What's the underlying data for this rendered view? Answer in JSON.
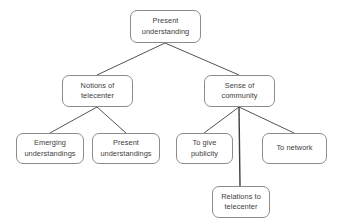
{
  "diagram": {
    "type": "tree-hierarchy",
    "orientation": "top-down",
    "style": {
      "node_border_color": "#8c8c8c",
      "node_fill_color": "#ffffff",
      "edge_color": "#3f3f3f",
      "text_color": "#3d3d3d",
      "background_color": "#ffffff"
    },
    "nodes": [
      {
        "id": "root",
        "label": "Present understanding",
        "x": 130,
        "y": 10,
        "w": 71,
        "h": 33
      },
      {
        "id": "notions",
        "label": "Notions of telecenter",
        "x": 62,
        "y": 75,
        "w": 71,
        "h": 32
      },
      {
        "id": "sense",
        "label": "Sense of community",
        "x": 204,
        "y": 75,
        "w": 71,
        "h": 32
      },
      {
        "id": "emerging",
        "label": "Emerging understandings",
        "x": 16,
        "y": 133,
        "w": 68,
        "h": 31
      },
      {
        "id": "present",
        "label": "Present understandings",
        "x": 92,
        "y": 133,
        "w": 68,
        "h": 31
      },
      {
        "id": "publicity",
        "label": "To give publicity",
        "x": 176,
        "y": 133,
        "w": 57,
        "h": 31
      },
      {
        "id": "network",
        "label": "To network",
        "x": 262,
        "y": 133,
        "w": 65,
        "h": 31
      },
      {
        "id": "relations",
        "label": "Relations to telecenter",
        "x": 212,
        "y": 186,
        "w": 58,
        "h": 32
      }
    ],
    "edges": [
      {
        "from": "root",
        "to": "notions",
        "x1": 165,
        "y1": 43,
        "x2": 97,
        "y2": 75
      },
      {
        "from": "root",
        "to": "sense",
        "x1": 165,
        "y1": 43,
        "x2": 239,
        "y2": 75
      },
      {
        "from": "notions",
        "to": "emerging",
        "x1": 97,
        "y1": 107,
        "x2": 50,
        "y2": 133
      },
      {
        "from": "notions",
        "to": "present",
        "x1": 97,
        "y1": 107,
        "x2": 126,
        "y2": 133
      },
      {
        "from": "sense",
        "to": "publicity",
        "x1": 239,
        "y1": 107,
        "x2": 204,
        "y2": 133
      },
      {
        "from": "sense",
        "to": "network",
        "x1": 239,
        "y1": 107,
        "x2": 294,
        "y2": 133
      },
      {
        "from": "sense",
        "to": "relations",
        "x1": 239,
        "y1": 107,
        "x2": 240,
        "y2": 186
      }
    ]
  }
}
